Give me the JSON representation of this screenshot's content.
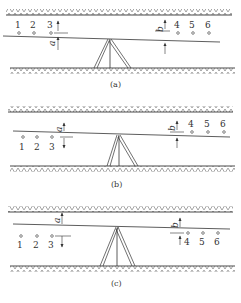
{
  "figure": {
    "panels": [
      {
        "id": "a",
        "caption": "(a)",
        "points": [
          "1",
          "2",
          "3",
          "4",
          "5",
          "6"
        ],
        "left_reading": "a",
        "right_reading": "b",
        "points_position": "above_sight_line"
      },
      {
        "id": "b",
        "caption": "(b)",
        "points": [
          "1",
          "2",
          "3",
          "4",
          "5",
          "6"
        ],
        "left_reading": "a",
        "right_reading": "b",
        "points_position": "left_below_right_above"
      },
      {
        "id": "c",
        "caption": "(c)",
        "points": [
          "1",
          "2",
          "3",
          "4",
          "5",
          "6"
        ],
        "left_reading": "a",
        "right_reading": "b",
        "points_position": "below_sight_line"
      }
    ],
    "colors": {
      "line": "#333333",
      "hatch": "#555555",
      "background": "#ffffff"
    }
  }
}
